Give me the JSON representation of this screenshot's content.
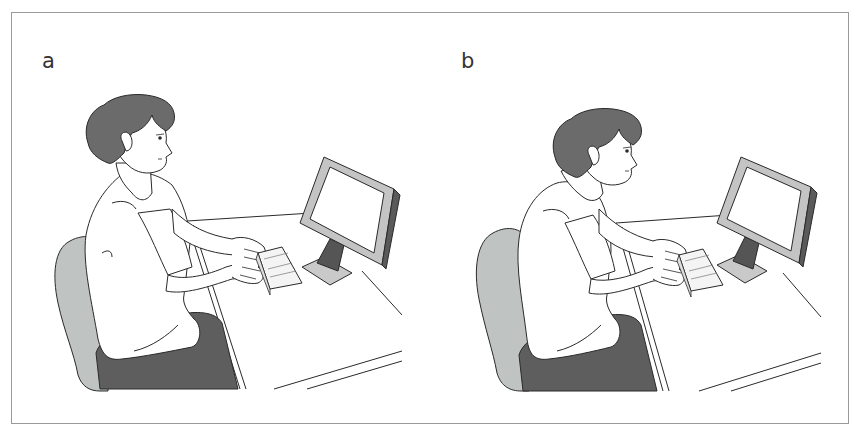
{
  "figure": {
    "panels": [
      {
        "label": "a",
        "description": "Seated person typing at a desk with upright posture, head level, looking at a monitor"
      },
      {
        "label": "b",
        "description": "Seated person typing at a desk with forward-leaning posture, head and neck thrust toward the monitor"
      }
    ],
    "colors": {
      "hair": "#6b6b6b",
      "pants": "#5e5e5e",
      "chair": "#bfc3c1",
      "monitor_bezel": "#c4c4c4",
      "monitor_side": "#5a5a5a",
      "stand_neck": "#555555",
      "stand_base": "#c9c9c9",
      "outline": "#2a2a2a",
      "frame_border": "#9a9a9a"
    }
  }
}
